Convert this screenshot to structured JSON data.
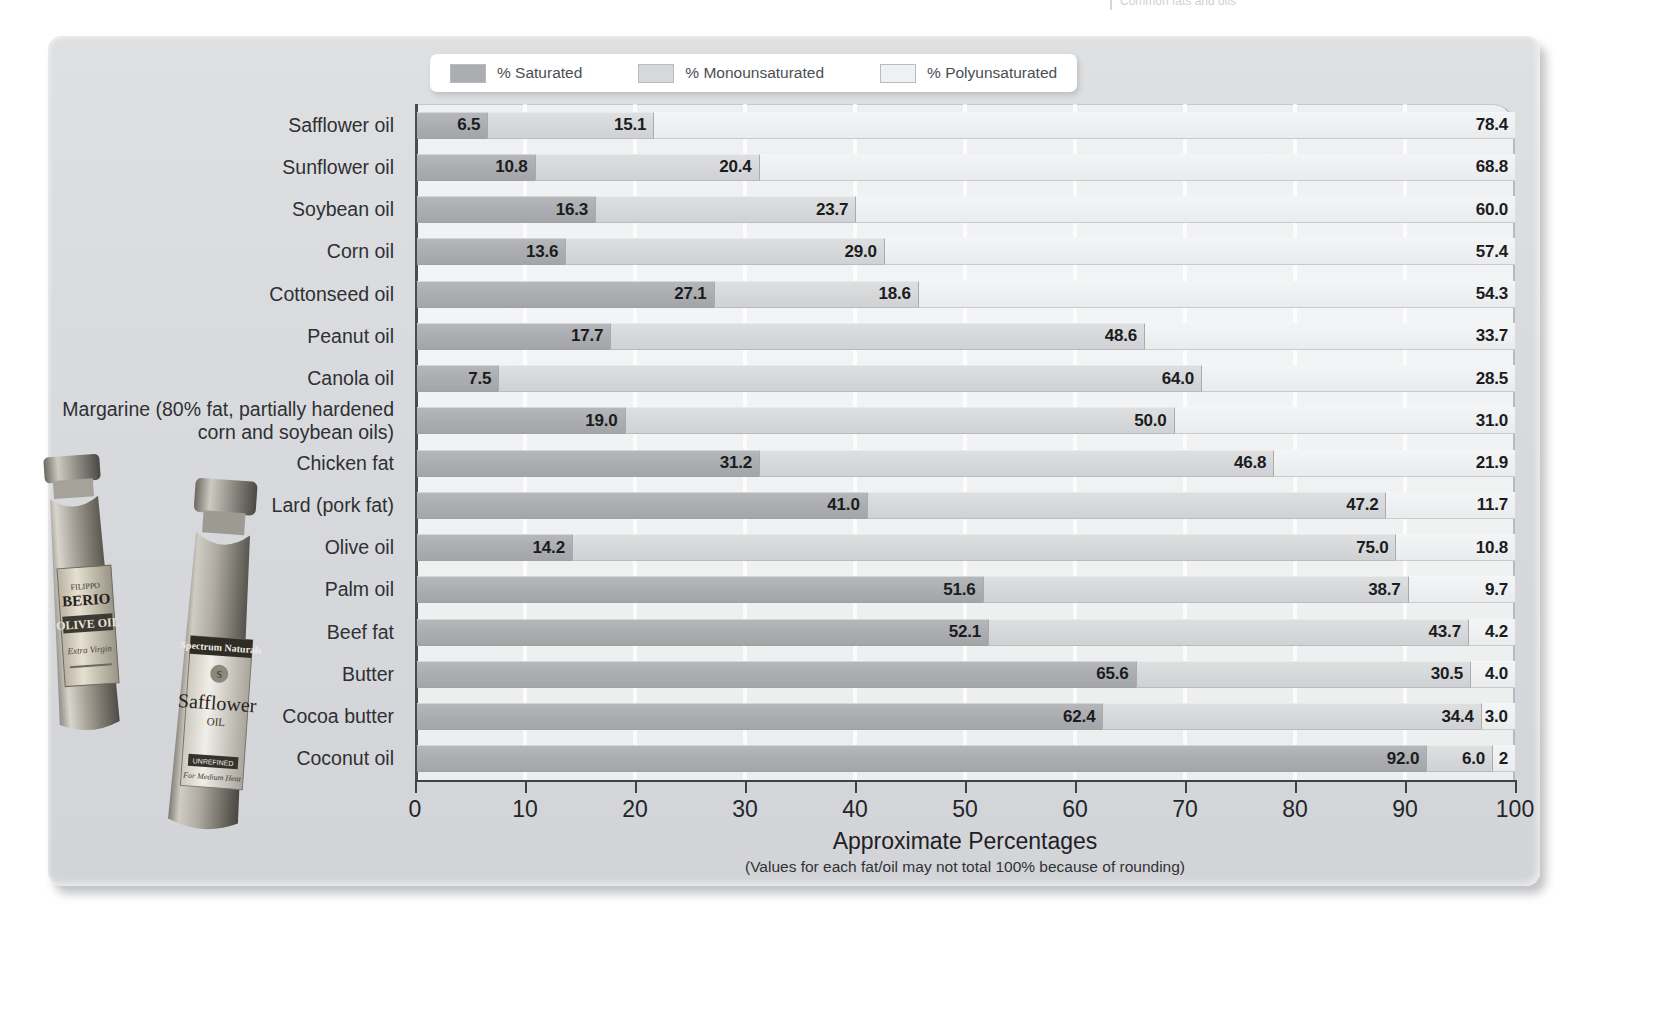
{
  "top_caption": "Common fats and oils",
  "legend": {
    "items": [
      {
        "label": "% Saturated",
        "color": "#abadb1",
        "key": "saturated"
      },
      {
        "label": "% Monounsaturated",
        "color": "#d7d8da",
        "key": "monounsaturated"
      },
      {
        "label": "% Polyunsaturated",
        "color": "#eff0f1",
        "key": "polyunsaturated"
      }
    ]
  },
  "axis": {
    "title": "Approximate Percentages",
    "note": "(Values for each fat/oil may not total 100% because of rounding)",
    "ticks": [
      "0",
      "10",
      "20",
      "30",
      "40",
      "50",
      "60",
      "70",
      "80",
      "90",
      "100"
    ],
    "min": 0,
    "max": 100
  },
  "chart_data": {
    "type": "bar",
    "orientation": "horizontal",
    "stacked": true,
    "title": "Common fats and oils",
    "xlabel": "Approximate Percentages",
    "ylabel": "",
    "xlim": [
      0,
      100
    ],
    "grid": true,
    "legend_position": "top",
    "categories": [
      "Safflower oil",
      "Sunflower oil",
      "Soybean oil",
      "Corn oil",
      "Cottonseed oil",
      "Peanut oil",
      "Canola oil",
      "Margarine (80% fat, partially hardened\ncorn and soybean oils)",
      "Chicken fat",
      "Lard (pork fat)",
      "Olive oil",
      "Palm oil",
      "Beef fat",
      "Butter",
      "Cocoa butter",
      "Coconut oil"
    ],
    "series": [
      {
        "name": "% Saturated",
        "color": "#abadb1",
        "values": [
          6.5,
          10.8,
          16.3,
          13.6,
          27.1,
          17.7,
          7.5,
          19.0,
          31.2,
          41.0,
          14.2,
          51.6,
          52.1,
          65.6,
          62.4,
          92.0
        ],
        "labels": [
          "6.5",
          "10.8",
          "16.3",
          "13.6",
          "27.1",
          "17.7",
          "7.5",
          "19.0",
          "31.2",
          "41.0",
          "14.2",
          "51.6",
          "52.1",
          "65.6",
          "62.4",
          "92.0"
        ]
      },
      {
        "name": "% Monounsaturated",
        "color": "#d7d8da",
        "values": [
          15.1,
          20.4,
          23.7,
          29.0,
          18.6,
          48.6,
          64.0,
          50.0,
          46.8,
          47.2,
          75.0,
          38.7,
          43.7,
          30.5,
          34.4,
          6.0
        ],
        "labels": [
          "15.1",
          "20.4",
          "23.7",
          "29.0",
          "18.6",
          "48.6",
          "64.0",
          "50.0",
          "46.8",
          "47.2",
          "75.0",
          "38.7",
          "43.7",
          "30.5",
          "34.4",
          "6.0"
        ]
      },
      {
        "name": "% Polyunsaturated",
        "color": "#eff0f1",
        "values": [
          78.4,
          68.8,
          60.0,
          57.4,
          54.3,
          33.7,
          28.5,
          31.0,
          21.9,
          11.7,
          10.8,
          9.7,
          4.2,
          4.0,
          3.0,
          2.0
        ],
        "labels": [
          "78.4",
          "68.8",
          "60.0",
          "57.4",
          "54.3",
          "33.7",
          "28.5",
          "31.0",
          "21.9",
          "11.7",
          "10.8",
          "9.7",
          "4.2",
          "4.0",
          "3.0",
          "2"
        ]
      }
    ]
  },
  "photo": {
    "caption_left": "FILIPPO BERIO OLIVE OIL",
    "caption_right": "Spectrum Naturals Safflower OIL"
  }
}
